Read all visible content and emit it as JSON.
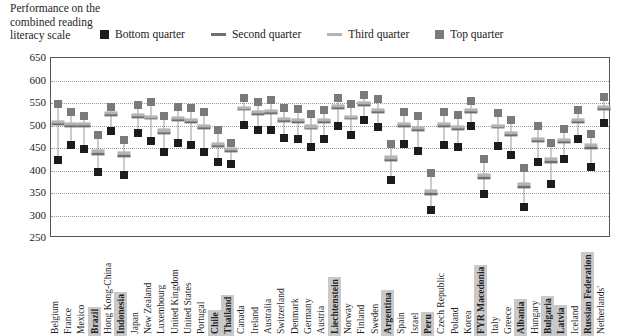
{
  "title": {
    "lines": [
      "Performance on the",
      "combined reading",
      "literacy scale"
    ]
  },
  "legend": {
    "position": "top",
    "items": [
      {
        "label": "Bottom quarter",
        "marker": "square",
        "color": "#1c1c1c",
        "name": "legend-bottom-quarter"
      },
      {
        "label": "Second quarter",
        "marker": "dash",
        "color": "#6e6e6e",
        "name": "legend-second-quarter"
      },
      {
        "label": "Third quarter",
        "marker": "dash",
        "color": "#b4b4b4",
        "name": "legend-third-quarter"
      },
      {
        "label": "Top quarter",
        "marker": "square",
        "color": "#7a7a7a",
        "name": "legend-top-quarter"
      }
    ]
  },
  "axis": {
    "yticks": [
      650,
      600,
      550,
      500,
      450,
      400,
      350,
      300,
      250
    ],
    "ylim": [
      250,
      650
    ]
  },
  "chart_data": {
    "type": "scatter",
    "title": "Performance on the combined reading literacy scale",
    "xlabel": "",
    "ylabel": "Performance on the combined reading literacy scale",
    "ylim": [
      250,
      650
    ],
    "ytick_step": 50,
    "grid": true,
    "legend_position": "top",
    "categories": [
      "Belgium",
      "France",
      "Mexico",
      "Brazil",
      "Hong Kong-China",
      "Indonesia",
      "Japan",
      "New Zealand",
      "Luxembourg",
      "United Kingdom",
      "United States",
      "Portugal",
      "Chile",
      "Thailand",
      "Canada",
      "Ireland",
      "Australia",
      "Switzerland",
      "Denmark",
      "Germany",
      "Austria",
      "Liechtenstein",
      "Norway",
      "Finland",
      "Sweden",
      "Argentina",
      "Spain",
      "Israel",
      "Peru",
      "Czech Republic",
      "Poland",
      "Korea",
      "FYR Macedonia",
      "Italy",
      "Greece",
      "Albania",
      "Hungary",
      "Bulgaria",
      "Latvia",
      "Iceland",
      "Russian Federation",
      "Netherlands'"
    ],
    "highlighted_categories": [
      "Brazil",
      "Indonesia",
      "Chile",
      "Thailand",
      "Liechtenstein",
      "Argentina",
      "Peru",
      "FYR Macedonia",
      "Albania",
      "Bulgaria",
      "Latvia",
      "Russian Federation"
    ],
    "series": [
      {
        "name": "Bottom quarter",
        "marker": "square",
        "color": "#1c1c1c",
        "values": [
          424,
          457,
          448,
          396,
          487,
          390,
          484,
          466,
          442,
          461,
          456,
          441,
          418,
          415,
          501,
          489,
          489,
          473,
          470,
          452,
          469,
          500,
          479,
          513,
          496,
          380,
          458,
          443,
          312,
          456,
          452,
          500,
          347,
          455,
          434,
          318,
          420,
          371,
          426,
          470,
          408,
          505
        ],
        "error_low": null
      },
      {
        "name": "Second quarter",
        "marker": "dash",
        "color": "#6e6e6e",
        "values": [
          503,
          500,
          500,
          437,
          523,
          432,
          519,
          516,
          484,
          512,
          509,
          495,
          455,
          444,
          536,
          526,
          528,
          510,
          508,
          494,
          508,
          540,
          516,
          547,
          530,
          423,
          500,
          490,
          348,
          499,
          493,
          531,
          383,
          496,
          479,
          363,
          466,
          420,
          463,
          508,
          451,
          538
        ],
        "error_low": null
      },
      {
        "name": "Third quarter",
        "marker": "dash",
        "color": "#b4b4b4",
        "values": [
          508,
          504,
          504,
          444,
          528,
          440,
          523,
          520,
          489,
          516,
          513,
          499,
          460,
          448,
          540,
          530,
          532,
          514,
          512,
          498,
          512,
          544,
          520,
          551,
          534,
          429,
          504,
          494,
          355,
          503,
          497,
          535,
          390,
          500,
          483,
          370,
          471,
          426,
          468,
          512,
          456,
          542
        ],
        "error_low": null
      },
      {
        "name": "Top quarter",
        "marker": "square",
        "color": "#7a7a7a",
        "values": [
          547,
          529,
          522,
          480,
          541,
          468,
          546,
          552,
          521,
          541,
          538,
          530,
          491,
          462,
          562,
          553,
          557,
          540,
          536,
          525,
          534,
          562,
          548,
          568,
          558,
          460,
          531,
          521,
          395,
          530,
          524,
          555,
          425,
          528,
          512,
          405,
          500,
          461,
          492,
          535,
          481,
          563
        ],
        "error_low": null
      }
    ]
  }
}
